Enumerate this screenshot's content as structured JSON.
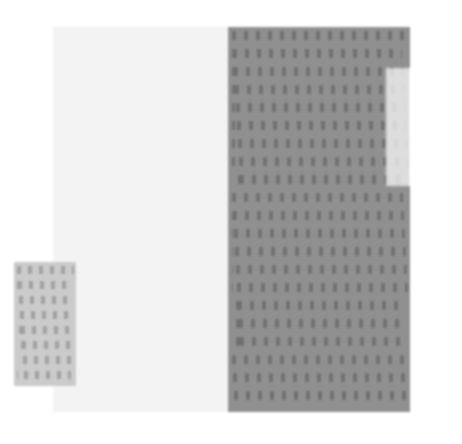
{
  "capture": {
    "title": "Blurred document screenshot",
    "width": 462,
    "height": 444,
    "background_color": "#ffffff",
    "note": "Heavily blurred / low-resolution capture; no text is legible at any zoom level."
  },
  "colors": {
    "canvas": "#ffffff",
    "page_panel": "#f3f3f3",
    "text_panel": "#8b8b8b",
    "text_glyph": "#686868",
    "snippet_panel": "#c9c9c9",
    "snippet_glyph": "#9a9a9a",
    "overlay_panel": "rgba(255,255,255,0.70)"
  },
  "regions": {
    "page_panel": {
      "name": "document-page",
      "x": 53,
      "y": 27,
      "width": 176,
      "height": 385,
      "content": "",
      "description": "blank near-white page column"
    },
    "text_panel": {
      "name": "document-text-column",
      "x": 228,
      "y": 27,
      "width": 182,
      "height": 385,
      "content": "",
      "description": "dark gray column filled with dense unreadable text lines",
      "line_count": 21,
      "line_spacing": 18
    },
    "snippet_panel": {
      "name": "text-snippet-block",
      "x": 14,
      "y": 262,
      "width": 62,
      "height": 124,
      "content": "",
      "description": "small gray block of unreadable text, lower left",
      "line_count": 8,
      "line_spacing": 15
    },
    "overlay_panel": {
      "name": "translucent-overlay",
      "x": 386,
      "y": 68,
      "width": 58,
      "height": 118,
      "content": "",
      "description": "semi-transparent white panel overlapping the right edge of the text column"
    }
  }
}
